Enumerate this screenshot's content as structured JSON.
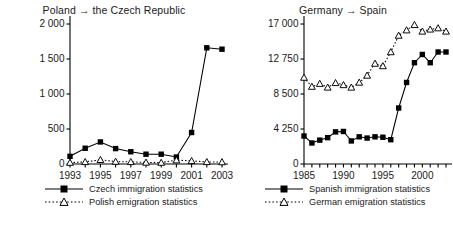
{
  "figure": {
    "background": "#ffffff",
    "series_colors": {
      "solid_square": "#000000",
      "dotted_triangle": "#000000"
    }
  },
  "chart_data": [
    {
      "panel": "left",
      "type": "line",
      "title": "Poland → the Czech Republic",
      "xlabel": "",
      "ylabel": "",
      "grid": false,
      "legend_position": "below",
      "x": [
        1993,
        1994,
        1995,
        1996,
        1997,
        1998,
        1999,
        2000,
        2001,
        2002,
        2003
      ],
      "xlim": [
        1993,
        2003
      ],
      "xticks": [
        1993,
        1994,
        1995,
        1996,
        1997,
        1998,
        1999,
        2000,
        2001,
        2002,
        2003
      ],
      "xtick_labels": [
        "1993",
        "",
        "1995",
        "",
        "1997",
        "",
        "1999",
        "",
        "2001",
        "",
        "2003"
      ],
      "ylim": [
        0,
        2000
      ],
      "yticks": [
        0,
        500,
        1000,
        1500,
        2000
      ],
      "ytick_labels": [
        "0",
        "500",
        "1 000",
        "1 500",
        "2 000"
      ],
      "series": [
        {
          "name": "Czech immigration statistics",
          "marker": "filled-square",
          "line": "solid",
          "values": [
            110,
            225,
            315,
            220,
            175,
            140,
            140,
            100,
            450,
            1660,
            1640
          ]
        },
        {
          "name": "Polish emigration statistics",
          "marker": "open-triangle",
          "line": "dotted",
          "values": [
            20,
            30,
            60,
            35,
            30,
            22,
            20,
            55,
            45,
            30,
            28
          ]
        }
      ]
    },
    {
      "panel": "right",
      "type": "line",
      "title": "Germany → Spain",
      "xlabel": "",
      "ylabel": "",
      "grid": false,
      "legend_position": "below",
      "x": [
        1985,
        1986,
        1987,
        1988,
        1989,
        1990,
        1991,
        1992,
        1993,
        1994,
        1995,
        1996,
        1997,
        1998,
        1999,
        2000,
        2001,
        2002,
        2003
      ],
      "xlim": [
        1985,
        2003
      ],
      "xticks": [
        1985,
        1986,
        1987,
        1988,
        1989,
        1990,
        1991,
        1992,
        1993,
        1994,
        1995,
        1996,
        1997,
        1998,
        1999,
        2000,
        2001,
        2002,
        2003
      ],
      "xtick_labels": [
        "1985",
        "",
        "",
        "",
        "",
        "1990",
        "",
        "",
        "",
        "",
        "1995",
        "",
        "",
        "",
        "",
        "2000",
        "",
        "",
        ""
      ],
      "ylim": [
        0,
        17000
      ],
      "yticks": [
        0,
        4250,
        8500,
        12750,
        17000
      ],
      "ytick_labels": [
        "0",
        "4 250",
        "8 500",
        "12 750",
        "17 000"
      ],
      "series": [
        {
          "name": "Spanish immigration statistics",
          "marker": "filled-square",
          "line": "solid",
          "values": [
            3400,
            2550,
            2900,
            3200,
            3900,
            3950,
            2800,
            3300,
            3150,
            3300,
            3250,
            2950,
            6800,
            9900,
            12300,
            13300,
            12300,
            13600,
            13600
          ]
        },
        {
          "name": "German emigration statistics",
          "marker": "open-triangle",
          "line": "dotted",
          "values": [
            10500,
            9400,
            9750,
            9300,
            9850,
            9600,
            9300,
            9900,
            10750,
            12200,
            11900,
            13600,
            15600,
            16250,
            16900,
            16100,
            16350,
            16500,
            16100
          ]
        }
      ]
    }
  ]
}
